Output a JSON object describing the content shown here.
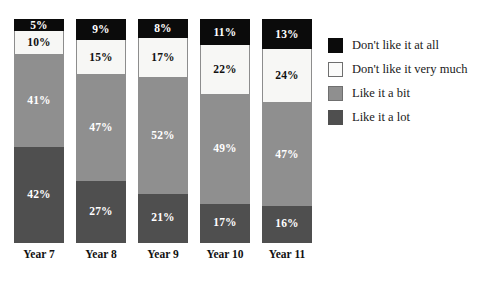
{
  "chart_data": {
    "type": "bar",
    "title": "",
    "subtitle": "",
    "xlabel": "",
    "ylabel": "",
    "ylim": [
      0,
      100
    ],
    "grid": false,
    "stacked": true,
    "stack_total": 100,
    "units": "%",
    "legend_position": "right",
    "categories": [
      "Year 7",
      "Year 8",
      "Year 9",
      "Year 10",
      "Year 11"
    ],
    "series": [
      {
        "name": "Don't like it at all",
        "color": "#0b0b0b",
        "values": [
          5,
          9,
          8,
          11,
          13
        ],
        "labels": [
          "5%",
          "9%",
          "8%",
          "11%",
          "13%"
        ]
      },
      {
        "name": "Don't like it very much",
        "color": "#f7f7f5",
        "values": [
          10,
          15,
          17,
          22,
          24
        ],
        "labels": [
          "10%",
          "15%",
          "17%",
          "22%",
          "24%"
        ]
      },
      {
        "name": "Like it a bit",
        "color": "#8f8f8f",
        "values": [
          41,
          47,
          52,
          49,
          47
        ],
        "labels": [
          "41%",
          "47%",
          "52%",
          "49%",
          "47%"
        ]
      },
      {
        "name": "Like it a lot",
        "color": "#4f4f4f",
        "values": [
          42,
          27,
          21,
          17,
          16
        ],
        "labels": [
          "42%",
          "27%",
          "21%",
          "17%",
          "16%"
        ]
      }
    ]
  },
  "legend": {
    "items": [
      {
        "label": "Don't like it at all",
        "swatch": "black-swatch"
      },
      {
        "label": "Don't like it very much",
        "swatch": "white-swatch"
      },
      {
        "label": "Like it a bit",
        "swatch": "mid-gray-swatch"
      },
      {
        "label": "Like it a lot",
        "swatch": "dark-gray-swatch"
      }
    ]
  },
  "bars": [
    {
      "category": "Year 7",
      "segments": [
        {
          "label": "5%",
          "value": 5,
          "series": "Don't like it at all"
        },
        {
          "label": "10%",
          "value": 10,
          "series": "Don't like it very much"
        },
        {
          "label": "41%",
          "value": 41,
          "series": "Like it a bit"
        },
        {
          "label": "42%",
          "value": 42,
          "series": "Like it a lot"
        }
      ]
    },
    {
      "category": "Year 8",
      "segments": [
        {
          "label": "9%",
          "value": 9,
          "series": "Don't like it at all"
        },
        {
          "label": "15%",
          "value": 15,
          "series": "Don't like it very much"
        },
        {
          "label": "47%",
          "value": 47,
          "series": "Like it a bit"
        },
        {
          "label": "27%",
          "value": 27,
          "series": "Like it a lot"
        }
      ]
    },
    {
      "category": "Year 9",
      "segments": [
        {
          "label": "8%",
          "value": 8,
          "series": "Don't like it at all"
        },
        {
          "label": "17%",
          "value": 17,
          "series": "Don't like it very much"
        },
        {
          "label": "52%",
          "value": 52,
          "series": "Like it a bit"
        },
        {
          "label": "21%",
          "value": 21,
          "series": "Like it a lot"
        }
      ]
    },
    {
      "category": "Year 10",
      "segments": [
        {
          "label": "11%",
          "value": 11,
          "series": "Don't like it at all"
        },
        {
          "label": "22%",
          "value": 22,
          "series": "Don't like it very much"
        },
        {
          "label": "49%",
          "value": 49,
          "series": "Like it a bit"
        },
        {
          "label": "17%",
          "value": 17,
          "series": "Like it a lot"
        }
      ]
    },
    {
      "category": "Year 11",
      "segments": [
        {
          "label": "13%",
          "value": 13,
          "series": "Don't like it at all"
        },
        {
          "label": "24%",
          "value": 24,
          "series": "Don't like it very much"
        },
        {
          "label": "47%",
          "value": 47,
          "series": "Like it a bit"
        },
        {
          "label": "16%",
          "value": 16,
          "series": "Like it a lot"
        }
      ]
    }
  ]
}
